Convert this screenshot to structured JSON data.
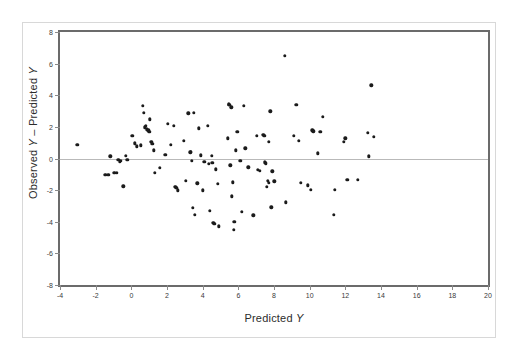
{
  "figure": {
    "background_color": "#ffffff",
    "frame_color": "#6b6b6b",
    "outer_frame_color": "#d8d8d8",
    "point_color": "#1b1b1b",
    "zero_line_color": "#b9b9b9"
  },
  "axis_titles": {
    "x_prefix": "Predicted ",
    "x_italic": "Y",
    "y_part1": "Observed ",
    "y_italic1": "Y",
    "y_middle": " – Predicted ",
    "y_italic2": "Y"
  },
  "chart_data": {
    "type": "scatter",
    "title": "",
    "xlabel": "Predicted Y",
    "ylabel": "Observed Y – Predicted Y",
    "xlim": [
      -4,
      20
    ],
    "ylim": [
      -8,
      8
    ],
    "xticks": [
      -4,
      -2,
      0,
      2,
      4,
      6,
      8,
      10,
      12,
      14,
      16,
      18,
      20
    ],
    "xticklabels": [
      "-4",
      "-2",
      "0",
      "2",
      "4",
      "6",
      "8",
      "10",
      "12",
      "14",
      "16",
      "18",
      "20"
    ],
    "yticks": [
      8,
      6,
      4,
      2,
      0,
      -2,
      -4,
      -6,
      -8
    ],
    "yticklabels": [
      "8",
      "6",
      "4",
      "2",
      "0",
      "-2",
      "-4",
      "-6",
      "-8"
    ],
    "grid": false,
    "legend": null,
    "reference_lines": [
      {
        "axis": "y",
        "value": 0,
        "style": "solid",
        "color": "#b9b9b9"
      }
    ],
    "marker": "filled-circle",
    "n_points": 124,
    "points": [
      [
        -3.02,
        0.86
      ],
      [
        -1.45,
        -1.02
      ],
      [
        -1.3,
        -1.03
      ],
      [
        -1.18,
        0.14
      ],
      [
        -0.95,
        -0.9
      ],
      [
        -0.8,
        -0.92
      ],
      [
        -0.72,
        -0.07
      ],
      [
        -0.65,
        -0.19
      ],
      [
        -0.58,
        -0.14
      ],
      [
        -0.46,
        -1.75
      ],
      [
        -0.3,
        0.16
      ],
      [
        -0.22,
        -0.1
      ],
      [
        0.05,
        1.42
      ],
      [
        0.18,
        0.95
      ],
      [
        0.3,
        0.78
      ],
      [
        0.52,
        0.84
      ],
      [
        0.65,
        3.33
      ],
      [
        0.7,
        2.9
      ],
      [
        0.75,
        1.98
      ],
      [
        0.8,
        2.05
      ],
      [
        0.88,
        1.84
      ],
      [
        0.95,
        1.78
      ],
      [
        1.0,
        1.7
      ],
      [
        1.05,
        2.47
      ],
      [
        1.12,
        1.05
      ],
      [
        1.18,
        0.92
      ],
      [
        1.25,
        0.52
      ],
      [
        1.3,
        -0.92
      ],
      [
        1.6,
        -0.6
      ],
      [
        1.9,
        0.25
      ],
      [
        2.05,
        2.18
      ],
      [
        2.2,
        0.88
      ],
      [
        2.38,
        2.07
      ],
      [
        2.45,
        -1.78
      ],
      [
        2.5,
        -1.82
      ],
      [
        2.55,
        -1.86
      ],
      [
        2.6,
        -2.02
      ],
      [
        2.95,
        1.12
      ],
      [
        3.05,
        -1.4
      ],
      [
        3.2,
        2.85
      ],
      [
        3.3,
        0.4
      ],
      [
        3.35,
        0.42
      ],
      [
        3.4,
        -0.15
      ],
      [
        3.45,
        -3.1
      ],
      [
        3.5,
        2.9
      ],
      [
        3.55,
        -3.55
      ],
      [
        3.7,
        -1.58
      ],
      [
        3.8,
        1.92
      ],
      [
        3.9,
        0.2
      ],
      [
        4.0,
        -2.02
      ],
      [
        4.1,
        -0.22
      ],
      [
        4.3,
        2.08
      ],
      [
        4.35,
        -0.32
      ],
      [
        4.4,
        -3.32
      ],
      [
        4.5,
        0.18
      ],
      [
        4.55,
        -0.28
      ],
      [
        4.6,
        -4.08
      ],
      [
        4.65,
        -4.12
      ],
      [
        4.75,
        -0.68
      ],
      [
        4.85,
        -1.6
      ],
      [
        4.9,
        -4.3
      ],
      [
        5.4,
        1.28
      ],
      [
        5.45,
        3.42
      ],
      [
        5.5,
        3.4
      ],
      [
        5.55,
        -0.42
      ],
      [
        5.6,
        3.25
      ],
      [
        5.65,
        -2.38
      ],
      [
        5.7,
        -1.5
      ],
      [
        5.75,
        -4.5
      ],
      [
        5.78,
        -4.02
      ],
      [
        5.85,
        0.52
      ],
      [
        5.95,
        1.7
      ],
      [
        6.1,
        -0.15
      ],
      [
        6.2,
        -3.38
      ],
      [
        6.3,
        3.35
      ],
      [
        6.4,
        0.65
      ],
      [
        6.55,
        -0.55
      ],
      [
        6.85,
        -3.6
      ],
      [
        7.05,
        1.42
      ],
      [
        7.1,
        -0.72
      ],
      [
        7.2,
        -0.78
      ],
      [
        7.4,
        1.5
      ],
      [
        7.45,
        1.45
      ],
      [
        7.5,
        -0.25
      ],
      [
        7.55,
        -0.3
      ],
      [
        7.6,
        -1.8
      ],
      [
        7.65,
        -1.42
      ],
      [
        7.7,
        -1.52
      ],
      [
        7.72,
        1.05
      ],
      [
        7.8,
        2.98
      ],
      [
        7.85,
        -3.08
      ],
      [
        7.9,
        -0.82
      ],
      [
        8.02,
        -1.45
      ],
      [
        8.6,
        6.48
      ],
      [
        8.65,
        -2.78
      ],
      [
        9.1,
        1.45
      ],
      [
        9.25,
        3.38
      ],
      [
        9.4,
        1.12
      ],
      [
        9.5,
        -1.52
      ],
      [
        9.9,
        -1.7
      ],
      [
        10.05,
        -1.98
      ],
      [
        10.15,
        1.78
      ],
      [
        10.2,
        1.72
      ],
      [
        10.45,
        0.32
      ],
      [
        10.6,
        1.68
      ],
      [
        10.75,
        2.62
      ],
      [
        11.35,
        -3.58
      ],
      [
        11.4,
        -1.98
      ],
      [
        11.9,
        1.05
      ],
      [
        12.0,
        1.28
      ],
      [
        12.1,
        -1.35
      ],
      [
        12.7,
        -1.35
      ],
      [
        13.25,
        1.62
      ],
      [
        13.3,
        0.15
      ],
      [
        13.45,
        4.62
      ],
      [
        13.6,
        1.38
      ]
    ]
  }
}
